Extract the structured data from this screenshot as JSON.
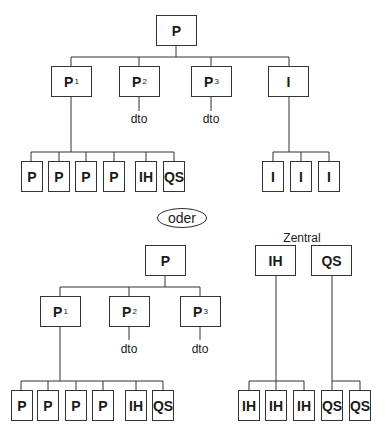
{
  "diagram": {
    "top_tree": {
      "root": {
        "label": "P"
      },
      "children": [
        {
          "label": "P",
          "sub": "1"
        },
        {
          "label": "P",
          "sub": "2",
          "note": "dto"
        },
        {
          "label": "P",
          "sub": "3",
          "note": "dto"
        },
        {
          "label": "I"
        }
      ],
      "p1_children": [
        "P",
        "P",
        "P",
        "P",
        "IH",
        "QS"
      ],
      "i_children": [
        "I",
        "I",
        "I"
      ]
    },
    "separator": {
      "label": "oder"
    },
    "bottom_left_tree": {
      "root": {
        "label": "P"
      },
      "children": [
        {
          "label": "P",
          "sub": "1"
        },
        {
          "label": "P",
          "sub": "2",
          "note": "dto"
        },
        {
          "label": "P",
          "sub": "3",
          "note": "dto"
        }
      ],
      "p1_children": [
        "P",
        "P",
        "P",
        "P",
        "IH",
        "QS"
      ]
    },
    "bottom_right_tree": {
      "heading": "Zentral",
      "ih_root": {
        "label": "IH"
      },
      "qs_root": {
        "label": "QS"
      },
      "ih_children": [
        "IH",
        "IH",
        "IH"
      ],
      "qs_children": [
        "QS",
        "QS"
      ]
    }
  }
}
